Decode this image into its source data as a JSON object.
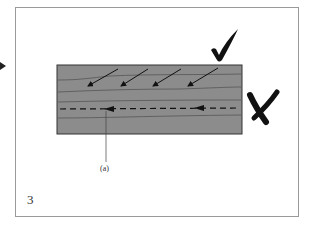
{
  "diagram": {
    "label_a": "(a)",
    "page_number": "3",
    "colors": {
      "block_fill": "#8c8c8c",
      "block_stroke": "#333333",
      "grain_line": "#555555",
      "arrow": "#111111",
      "mark": "#111111",
      "frame": "#9a9a9a"
    },
    "marks": {
      "correct": "check-mark",
      "incorrect": "x-mark"
    },
    "elements": {
      "diagonal_arrows_count": 4,
      "dashed_line_arrows_count": 2
    }
  }
}
